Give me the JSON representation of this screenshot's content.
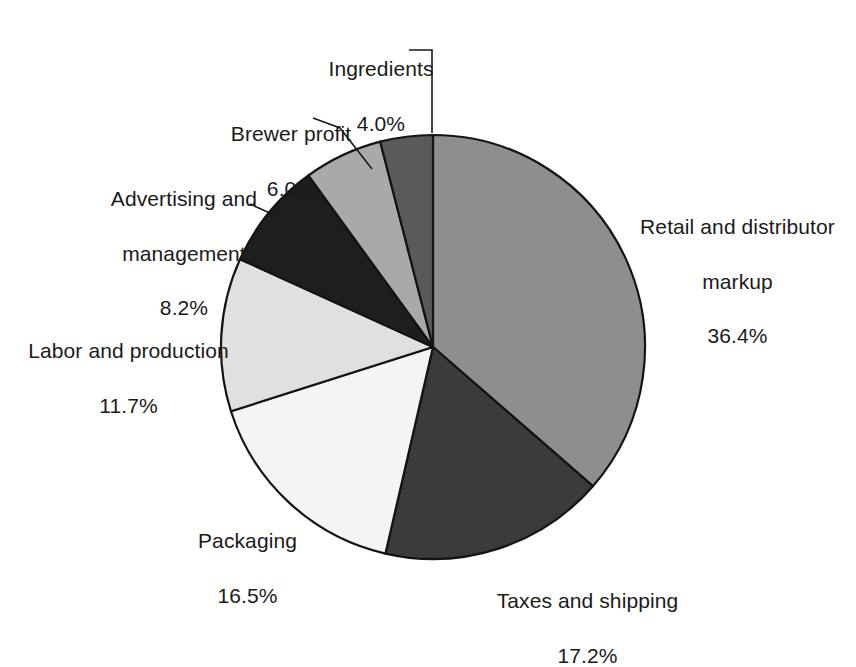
{
  "chart_data": {
    "type": "pie",
    "title": "",
    "subtitle": "",
    "xlabel": "",
    "ylabel": "",
    "legend_position": "none",
    "grid": false,
    "labels_show_percent": true,
    "start_angle_deg": 0,
    "direction": "clockwise",
    "categories": [
      "Retail and distributor markup",
      "Taxes and shipping",
      "Packaging",
      "Labor and production",
      "Advertising and management",
      "Brewer profit",
      "Ingredients"
    ],
    "values": [
      36.4,
      17.2,
      16.5,
      11.7,
      8.2,
      6.0,
      4.0
    ],
    "slices": [
      {
        "label": "Retail and distributor markup",
        "label_line1": "Retail and distributor",
        "label_line2": "markup",
        "value": 36.4,
        "value_text": "36.4%",
        "color": "#8e8e8e"
      },
      {
        "label": "Taxes and shipping",
        "label_line1": "Taxes and shipping",
        "label_line2": "",
        "value": 17.2,
        "value_text": "17.2%",
        "color": "#3b3b3b"
      },
      {
        "label": "Packaging",
        "label_line1": "Packaging",
        "label_line2": "",
        "value": 16.5,
        "value_text": "16.5%",
        "color": "#f4f4f4"
      },
      {
        "label": "Labor and production",
        "label_line1": "Labor and production",
        "label_line2": "",
        "value": 11.7,
        "value_text": "11.7%",
        "color": "#e0e0e0"
      },
      {
        "label": "Advertising and management",
        "label_line1": "Advertising and",
        "label_line2": "management",
        "value": 8.2,
        "value_text": "8.2%",
        "color": "#1e1e1e"
      },
      {
        "label": "Brewer profit",
        "label_line1": "Brewer profit",
        "label_line2": "",
        "value": 6.0,
        "value_text": "6.0%",
        "color": "#a9a9a9"
      },
      {
        "label": "Ingredients",
        "label_line1": "Ingredients",
        "label_line2": "",
        "value": 4.0,
        "value_text": "4.0%",
        "color": "#5a5a5a"
      }
    ],
    "total": 100.0,
    "geometry": {
      "center_x": 433,
      "center_y": 347,
      "radius": 212
    },
    "colors": {
      "outline": "#141414",
      "background": "#ffffff",
      "text": "#1a1a1a"
    }
  },
  "callouts": {
    "ingredients": {
      "line1": "Ingredients",
      "line2": "4.0%"
    },
    "brewer": {
      "line1": "Brewer profit",
      "line2": "6.0%"
    },
    "advertising": {
      "line1": "Advertising and",
      "line2": "management",
      "line3": "8.2%"
    },
    "labor": {
      "line1": "Labor and production",
      "line2": "11.7%"
    },
    "packaging": {
      "line1": "Packaging",
      "line2": "16.5%"
    },
    "taxes": {
      "line1": "Taxes and shipping",
      "line2": "17.2%"
    },
    "retail": {
      "line1": "Retail and distributor",
      "line2": "markup",
      "line3": "36.4%"
    }
  }
}
